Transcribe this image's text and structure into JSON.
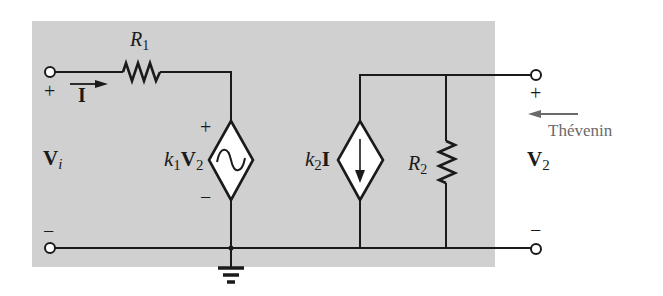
{
  "figure": {
    "type": "circuit-schematic",
    "background_panel_color": "#d0d0d0",
    "wire_color": "#1a1a1a",
    "annotation_color": "#6a6a6a"
  },
  "labels": {
    "r1_letter": "R",
    "r1_sub": "1",
    "r2_letter": "R",
    "r2_sub": "2",
    "current_I": "I",
    "input_plus": "+",
    "input_minus": "−",
    "vi_letter": "V",
    "vi_sub": "i",
    "vsrc_plus": "+",
    "vsrc_minus": "−",
    "vsrc_k": "k",
    "vsrc_k_sub": "1",
    "vsrc_V": "V",
    "vsrc_V_sub": "2",
    "isrc_k": "k",
    "isrc_k_sub": "2",
    "isrc_I": "I",
    "output_plus": "+",
    "output_minus": "−",
    "v2_letter": "V",
    "v2_sub": "2",
    "thevenin": "Thévenin"
  },
  "components": [
    {
      "id": "R1",
      "kind": "resistor",
      "label": "R1"
    },
    {
      "id": "VCVS",
      "kind": "dependent-voltage-source",
      "label": "k1V2"
    },
    {
      "id": "CCCS",
      "kind": "dependent-current-source",
      "label": "k2I"
    },
    {
      "id": "R2",
      "kind": "resistor",
      "label": "R2"
    },
    {
      "id": "GND",
      "kind": "ground"
    }
  ]
}
